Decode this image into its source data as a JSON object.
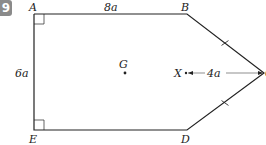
{
  "question_number": "9",
  "diagram": {
    "vertices": {
      "A": {
        "label": "A"
      },
      "B": {
        "label": "B"
      },
      "C": {
        "label": "C"
      },
      "D": {
        "label": "D"
      },
      "E": {
        "label": "E"
      }
    },
    "points": {
      "G": {
        "label": "G"
      },
      "X": {
        "label": "X"
      }
    },
    "dimensions": {
      "AB": "8a",
      "AE": "6a",
      "XC": "4a"
    },
    "colors": {
      "line": "#222222",
      "badge": "#8a8a8a"
    }
  }
}
